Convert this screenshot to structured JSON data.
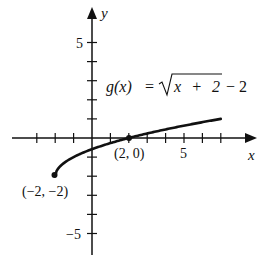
{
  "chart_data": {
    "type": "line",
    "title": "",
    "function_label": "g(x) = √(x + 2) − 2",
    "function_label_parts": {
      "lhs": "g(x)",
      "eq": "=",
      "radicand": "x + 2",
      "tail": "− 2"
    },
    "xlabel": "x",
    "ylabel": "y",
    "xlim": [
      -4,
      8.5
    ],
    "ylim": [
      -6,
      7
    ],
    "grid": false,
    "x_ticks": [
      -3,
      -2,
      -1,
      1,
      2,
      3,
      4,
      5,
      6,
      7
    ],
    "y_ticks": [
      -5,
      -4,
      -3,
      -2,
      -1,
      1,
      2,
      3,
      4,
      5
    ],
    "x_tick_labels": [
      {
        "value": 5,
        "text": "5"
      }
    ],
    "y_tick_labels": [
      {
        "value": 5,
        "text": "5"
      },
      {
        "value": -5,
        "text": "−5"
      }
    ],
    "series": [
      {
        "name": "g(x)",
        "x": [
          -2,
          -1.75,
          -1.5,
          -1,
          0,
          1,
          2,
          3,
          4,
          5,
          6,
          7
        ],
        "values": [
          -2,
          -1.5,
          -1.29,
          -1,
          -0.59,
          -0.27,
          0,
          0.24,
          0.45,
          0.65,
          0.83,
          1
        ]
      }
    ],
    "annotations": [
      {
        "point": [
          -2,
          -2
        ],
        "text": "(−2, −2)",
        "marker": "filled-dot"
      },
      {
        "point": [
          2,
          0
        ],
        "text": "(2, 0)",
        "marker": "filled-dot"
      }
    ]
  }
}
